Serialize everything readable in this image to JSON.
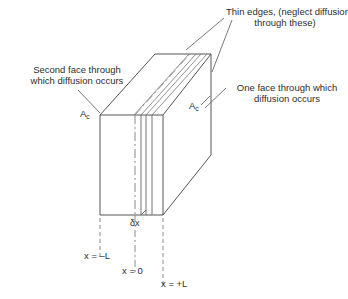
{
  "figure": {
    "background_color": "#ffffff",
    "line_color": "#555555",
    "text_color": "#2e2e2e",
    "width": 348,
    "height": 299
  },
  "annotations": {
    "thin_edges": "Thin edges, (neglect diffusion\nthrough these)",
    "second_face": "Second face through\nwhich diffusion occurs",
    "one_face": "One face through which\ndiffusion occurs",
    "area_left_symbol": "A",
    "area_left_subscript": "c",
    "area_right_symbol": "A",
    "area_right_subscript": "c",
    "element_thickness": "δx"
  },
  "axis_markers": {
    "left": "x = –L",
    "center": "x = 0",
    "right": "x = +L"
  },
  "geometry": {
    "front_face": {
      "left_x": 100,
      "right_x": 163,
      "top_y": 115,
      "bottom_y": 215,
      "description": "One face through which diffusion occurs"
    },
    "depth_offset": {
      "dx": 55,
      "dy": -61,
      "description": "oblique projection offset to back face"
    },
    "centerline_x": 135,
    "element_left_x": 141,
    "element_right_x": 152,
    "hatch_count": 4
  }
}
